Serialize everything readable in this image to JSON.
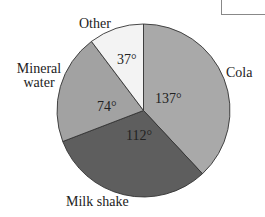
{
  "chart_data": {
    "type": "pie",
    "title": "",
    "unit": "degrees",
    "start_angle_deg": 0,
    "direction": "clockwise",
    "categories": [
      "Cola",
      "Milk shake",
      "Mineral water",
      "Other"
    ],
    "values": [
      137,
      112,
      74,
      37
    ],
    "value_labels": [
      "137°",
      "112°",
      "74°",
      "37°"
    ],
    "colors": [
      "#a9a9a9",
      "#5e5e5e",
      "#a2a2a2",
      "#f3f3f3"
    ],
    "total": 360,
    "legend": "none (labels placed outside slices)"
  },
  "labels": {
    "cola": "Cola",
    "milk_shake": "Milk shake",
    "mineral_line1": "Mineral",
    "mineral_line2": "water",
    "other": "Other"
  },
  "degree_labels": {
    "cola": "137°",
    "milk_shake": "112°",
    "mineral_water": "74°",
    "other": "37°"
  },
  "geometry": {
    "cx": 143.5,
    "cy": 110.5,
    "r": 86.5
  },
  "stroke_color": "#333333"
}
